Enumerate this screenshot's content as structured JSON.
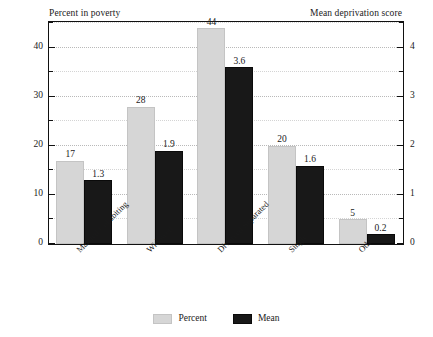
{
  "chart_data": {
    "type": "bar",
    "title": "",
    "categories": [
      "Married/Cohabiting",
      "Widowed",
      "Divorced/Separated",
      "Single",
      "Other"
    ],
    "series": [
      {
        "name": "Percent",
        "axis": "left",
        "color": "#d6d6d6",
        "values": [
          17,
          28,
          44,
          20,
          5
        ],
        "labels": [
          "17",
          "28",
          "44",
          "20",
          "5"
        ]
      },
      {
        "name": "Mean",
        "axis": "right",
        "color": "#181818",
        "values": [
          1.3,
          1.9,
          3.6,
          1.6,
          0.2
        ],
        "labels": [
          "1.3",
          "1.9",
          "3.6",
          "1.6",
          "0.2"
        ]
      }
    ],
    "left_axis": {
      "label": "Percent in poverty",
      "ylim": [
        0,
        45
      ],
      "major_ticks": [
        0,
        10,
        20,
        30,
        40
      ],
      "major_tick_labels": [
        "0",
        "10",
        "20",
        "30",
        "40"
      ],
      "minor_ticks": [
        5,
        15,
        25,
        35,
        45
      ]
    },
    "right_axis": {
      "label": "Mean deprivation score",
      "ylim": [
        0,
        4.5
      ],
      "major_ticks": [
        0,
        1,
        2,
        3,
        4
      ],
      "major_tick_labels": [
        "0",
        "1",
        "2",
        "3",
        "4"
      ],
      "minor_ticks": [
        0.5,
        1.5,
        2.5,
        3.5,
        4.5
      ]
    },
    "xlabel": "",
    "grid": "horizontal-dotted",
    "legend_position": "bottom-center",
    "legend": [
      {
        "label": "Percent",
        "swatch": "percent"
      },
      {
        "label": "Mean",
        "swatch": "mean"
      }
    ]
  }
}
